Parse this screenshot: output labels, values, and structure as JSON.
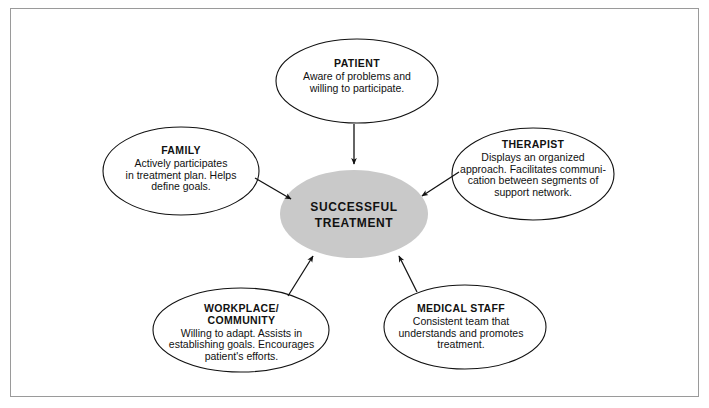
{
  "figure": {
    "kind": "radial-concept-diagram",
    "border_color": "#9a9a9a",
    "background": "#ffffff",
    "outline_color": "#111111",
    "center_fill": "#c9c9c9"
  },
  "center": {
    "title": "SUCCESSFUL\nTREATMENT"
  },
  "nodes": [
    {
      "key": "patient",
      "title": "PATIENT",
      "desc": "Aware of problems and\nwilling to participate."
    },
    {
      "key": "family",
      "title": "FAMILY",
      "desc": "Actively participates\nin treatment plan. Helps\ndefine goals."
    },
    {
      "key": "therapist",
      "title": "THERAPIST",
      "desc": "Displays an organized\napproach. Facilitates communi-\ncation between segments of\nsupport network."
    },
    {
      "key": "workplace",
      "title": "WORKPLACE/\nCOMMUNITY",
      "desc": "Willing to adapt. Assists in\nestablishing goals. Encourages\npatient's efforts."
    },
    {
      "key": "medical",
      "title": "MEDICAL  STAFF",
      "desc": "Consistent team that\nunderstands and promotes\ntreatment."
    }
  ],
  "connectors": [
    {
      "from": "patient",
      "to": "center",
      "direction": "down"
    },
    {
      "from": "family",
      "to": "center",
      "direction": "down-right"
    },
    {
      "from": "therapist",
      "to": "center",
      "direction": "down-left"
    },
    {
      "from": "workplace",
      "to": "center",
      "direction": "up-right"
    },
    {
      "from": "medical",
      "to": "center",
      "direction": "up-left"
    }
  ]
}
